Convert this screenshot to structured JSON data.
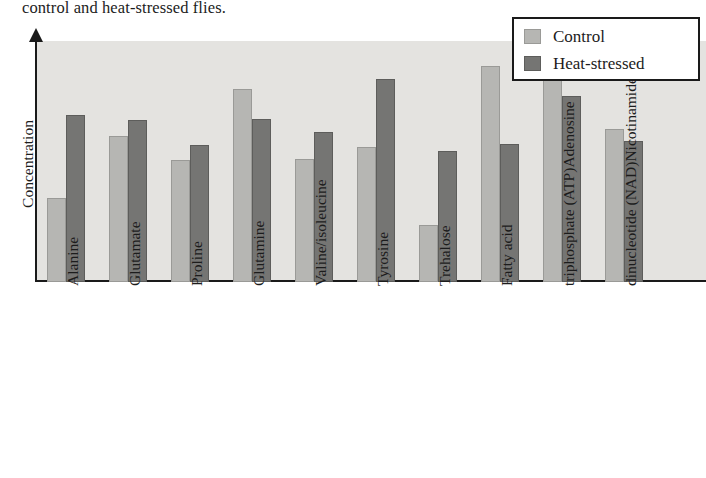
{
  "caption": "control and heat-stressed flies.",
  "legend": {
    "position": "top-right",
    "entries": [
      {
        "label": "Control",
        "swatch": "control-swatch",
        "color": "#b6b6b3"
      },
      {
        "label": "Heat-stressed",
        "swatch": "stressed-swatch",
        "color": "#757573"
      }
    ]
  },
  "axes": {
    "ylabel": "Concentration",
    "xlabel": ""
  },
  "chart_data": {
    "type": "bar",
    "title": "",
    "subtitle": "",
    "xlabel": "",
    "ylabel": "Concentration",
    "grid": false,
    "legend_position": "top-right",
    "yticks": [],
    "ylim": [
      0,
      180
    ],
    "categories": [
      "Alanine",
      "Glutamate",
      "Proline",
      "Glutamine",
      "Valine/isoleucine",
      "Tyrosine",
      "Trehalose",
      "Fatty acid",
      "Adenosine triphosphate (ATP)",
      "Nicotinamide adenine dinucleotide (NAD)"
    ],
    "category_label_lines": [
      [
        "Alanine"
      ],
      [
        "Glutamate"
      ],
      [
        "Proline"
      ],
      [
        "Glutamine"
      ],
      [
        "Valine/isoleucine"
      ],
      [
        "Tyrosine"
      ],
      [
        "Trehalose"
      ],
      [
        "Fatty acid"
      ],
      [
        "Adenosine",
        "triphosphate (ATP)"
      ],
      [
        "Nicotinamide adenine",
        "dinucleotide (NAD)"
      ]
    ],
    "series": [
      {
        "name": "Control",
        "color": "#b6b6b3",
        "values": [
          63,
          110,
          92,
          145,
          93,
          102,
          43,
          163,
          162,
          115
        ]
      },
      {
        "name": "Heat-stressed",
        "color": "#757573",
        "values": [
          126,
          122,
          103,
          123,
          113,
          153,
          99,
          104,
          140,
          106
        ]
      }
    ]
  },
  "layout": {
    "plot_left": 37,
    "plot_top": 41,
    "plot_width": 669,
    "plot_height": 239,
    "baseline_y": 280,
    "bar_width": 19,
    "group_step": 62,
    "first_group_left": 47
  }
}
